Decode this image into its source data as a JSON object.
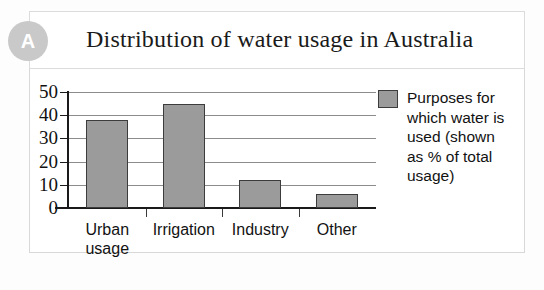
{
  "badge": {
    "label": "A"
  },
  "title": "Distribution of water usage in Australia",
  "legend": {
    "lines": [
      "Purposes for",
      "which water is",
      "used (shown",
      "as % of total",
      "usage)"
    ]
  },
  "colors": {
    "bar_fill": "#9b9b9b",
    "bar_stroke": "#3c3c3c",
    "badge": "#c9c9c9",
    "gridline": "#8c8c8c",
    "axis": "#1a1a1a",
    "frame": "#d8d8d8"
  },
  "chart_data": {
    "type": "bar",
    "title": "Distribution of water usage in Australia",
    "categories": [
      "Urban usage",
      "Irrigation",
      "Industry",
      "Other"
    ],
    "category_lines": [
      [
        "Urban",
        "usage"
      ],
      [
        "Irrigation"
      ],
      [
        "Industry"
      ],
      [
        "Other"
      ]
    ],
    "values": [
      38,
      45,
      12,
      6
    ],
    "series": [
      {
        "name": "Purposes for which water is used (shown as % of total usage)",
        "values": [
          38,
          45,
          12,
          6
        ]
      }
    ],
    "xlabel": "",
    "ylabel": "",
    "ylim": [
      0,
      50
    ],
    "yticks": [
      0,
      10,
      20,
      30,
      40,
      50
    ],
    "ytick_labels": [
      "0",
      "10",
      "20",
      "30",
      "40",
      "50"
    ],
    "grid": true,
    "legend_position": "right",
    "units": "% of total usage"
  }
}
